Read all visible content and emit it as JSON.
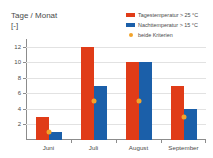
{
  "chart_data": {
    "type": "bar",
    "title": "",
    "ylabel": "Tage / Monat",
    "yunit": "[-]",
    "xlabel": "",
    "categories": [
      "Juni",
      "Juli",
      "August",
      "September"
    ],
    "ylim": [
      0,
      13
    ],
    "yticks": [
      2,
      4,
      6,
      8,
      10,
      12
    ],
    "grid": true,
    "legend_position": "top-right",
    "series": [
      {
        "name": "Tagestemperatur > 25 °C",
        "type": "bar",
        "color": "#E03C18",
        "values": [
          3,
          12,
          10,
          7
        ]
      },
      {
        "name": "Nachttemperatur > 15 °C",
        "type": "bar",
        "color": "#1B5FA9",
        "values": [
          1,
          7,
          10,
          4
        ]
      },
      {
        "name": "beide Kriterien",
        "type": "scatter",
        "color": "#F2A32A",
        "values": [
          1,
          5,
          5,
          3
        ]
      }
    ]
  },
  "legend": {
    "items": [
      {
        "label": "Tagestemperatur > 25 °C",
        "swatch": "bar",
        "color": "#E03C18"
      },
      {
        "label": "Nachttemperatur > 15 °C",
        "swatch": "bar",
        "color": "#1B5FA9"
      },
      {
        "label": "beide Kriterien",
        "swatch": "dot",
        "color": "#F2A32A"
      }
    ]
  },
  "axis": {
    "y_title": "Tage / Monat",
    "y_unit": "[-]",
    "tick_2": "2",
    "tick_4": "4",
    "tick_6": "6",
    "tick_8": "8",
    "tick_10": "10",
    "tick_12": "12",
    "x_1": "Juni",
    "x_2": "Juli",
    "x_3": "August",
    "x_4": "September"
  },
  "colors": {
    "day": "#E03C18",
    "night": "#1B5FA9",
    "both": "#F2A32A",
    "grid": "#E2E2E2",
    "axis": "#8C8C8C",
    "text": "#4A4A4A",
    "background": "#FFFFFF"
  }
}
